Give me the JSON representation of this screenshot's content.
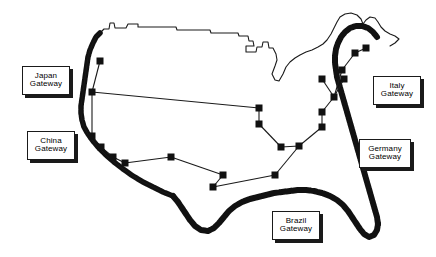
{
  "figure": {
    "kind": "network-map",
    "region": "United States",
    "background_color": "#ffffff",
    "line_color": "#1a1a1a",
    "node_color": "#111111",
    "coast_fill_color": "#111111"
  },
  "gateways": [
    {
      "id": "japan",
      "country": "Japan",
      "word": "Gateway",
      "x": 22,
      "y": 66,
      "w": 48,
      "h": 29
    },
    {
      "id": "china",
      "country": "China",
      "word": "Gateway",
      "x": 27,
      "y": 131,
      "w": 48,
      "h": 29
    },
    {
      "id": "italy",
      "country": "Italy",
      "word": "Gateway",
      "x": 373,
      "y": 76,
      "w": 48,
      "h": 29
    },
    {
      "id": "germany",
      "country": "Germany",
      "word": "Gateway",
      "x": 359,
      "y": 139,
      "w": 52,
      "h": 29
    },
    {
      "id": "brazil",
      "country": "Brazil",
      "word": "Gateway",
      "x": 272,
      "y": 211,
      "w": 48,
      "h": 29
    }
  ],
  "nodes": [
    {
      "id": "n1",
      "x": 100,
      "y": 61
    },
    {
      "id": "n2",
      "x": 92,
      "y": 92
    },
    {
      "id": "n3",
      "x": 92,
      "y": 136
    },
    {
      "id": "n4",
      "x": 101,
      "y": 147
    },
    {
      "id": "n5",
      "x": 113,
      "y": 157
    },
    {
      "id": "n6",
      "x": 125,
      "y": 163
    },
    {
      "id": "n7",
      "x": 171,
      "y": 157
    },
    {
      "id": "n8",
      "x": 223,
      "y": 175
    },
    {
      "id": "n9",
      "x": 213,
      "y": 187
    },
    {
      "id": "n10",
      "x": 259,
      "y": 108
    },
    {
      "id": "n11",
      "x": 259,
      "y": 124
    },
    {
      "id": "n12",
      "x": 275,
      "y": 175
    },
    {
      "id": "n13",
      "x": 281,
      "y": 147
    },
    {
      "id": "n14",
      "x": 299,
      "y": 146
    },
    {
      "id": "n15",
      "x": 322,
      "y": 112
    },
    {
      "id": "n16",
      "x": 322,
      "y": 127
    },
    {
      "id": "n17",
      "x": 334,
      "y": 97
    },
    {
      "id": "n18",
      "x": 344,
      "y": 79
    },
    {
      "id": "n19",
      "x": 322,
      "y": 79
    },
    {
      "id": "n20",
      "x": 342,
      "y": 70
    },
    {
      "id": "n21",
      "x": 355,
      "y": 53
    },
    {
      "id": "n22",
      "x": 366,
      "y": 48
    }
  ],
  "links": [
    [
      "n1",
      "n2"
    ],
    [
      "n2",
      "n3"
    ],
    [
      "n2",
      "n10"
    ],
    [
      "n3",
      "n4"
    ],
    [
      "n4",
      "n5"
    ],
    [
      "n5",
      "n6"
    ],
    [
      "n6",
      "n7"
    ],
    [
      "n7",
      "n8"
    ],
    [
      "n8",
      "n9"
    ],
    [
      "n9",
      "n12"
    ],
    [
      "n10",
      "n11"
    ],
    [
      "n11",
      "n13"
    ],
    [
      "n13",
      "n14"
    ],
    [
      "n14",
      "n12"
    ],
    [
      "n14",
      "n16"
    ],
    [
      "n16",
      "n15"
    ],
    [
      "n15",
      "n17"
    ],
    [
      "n17",
      "n19"
    ],
    [
      "n17",
      "n18"
    ],
    [
      "n17",
      "n20"
    ],
    [
      "n20",
      "n21"
    ],
    [
      "n21",
      "n22"
    ]
  ],
  "node_size": 7,
  "border_outline": "M 100 33 L 104 29 L 109 29 L 110 23 L 114 23 L 115 28 L 126 28 L 128 24 L 138 24 L 138 27 L 176 27 L 177 30 L 210 30 L 211 33 L 238 33 L 239 36 L 248 36 L 249 41 L 253 41 L 254 46 L 246 46 L 246 52 L 256 52 L 257 47 L 262 47 L 263 42 L 268 42 L 269 48 L 273 48 L 276 54 L 277 60 L 275 66 L 272 74 L 275 80 L 279 81 L 283 74 L 286 67 L 290 62 L 295 58 L 300 55 L 306 52 L 312 50 L 318 47 L 323 44 L 327 40 L 331 34 L 334 28 L 337 22 L 340 17 L 345 14 L 351 13 L 357 15 L 361 19 L 363 24 L 366 20 L 370 17 L 375 18 L 378 22 L 381 27 L 385 31 L 390 34 L 395 36 L 399 39 L 395 43 L 390 46",
  "west_coast": "M 100 33 L 96 37 L 93 43 L 90 50 L 88 57 L 87 64 L 86 71 L 85 78 L 84 85 L 83 92 L 82 99 L 81 106 L 81 113 L 82 120 L 84 127 L 88 134 L 93 141 L 99 148 L 106 155 L 114 162 L 123 169 L 133 176 L 143 182 L 153 187 L 163 192 L 173 196",
  "gulf_coast": "M 173 196 L 178 202 L 182 208 L 186 214 L 190 220 L 195 226 L 201 230 L 208 231 L 214 228 L 219 223 L 224 217 L 229 211 L 235 206 L 242 202 L 250 199 L 258 197 L 266 195 L 274 193 L 282 192 L 290 191 L 298 190 L 306 190 L 314 191 L 322 193 L 330 196 L 337 200 L 343 205 L 348 211 L 352 217 L 356 223 L 360 229 L 364 234 L 369 237 L 374 235 L 377 230 L 378 224",
  "east_coast": "M 378 224 L 377 217 L 375 210 L 373 203 L 371 196 L 369 189 L 367 182 L 365 175 L 363 168 L 361 161 L 359 154 L 357 147 L 355 140 L 353 133 L 351 126 L 349 119 L 347 112 L 345 105 L 343 98 L 341 91 L 339 84 L 337 77 L 336 70 L 335 63 L 335 56 L 336 49 L 338 43 L 341 37 L 345 32 L 350 28 L 356 26 L 362 26 L 368 28 L 373 32 L 377 37"
}
